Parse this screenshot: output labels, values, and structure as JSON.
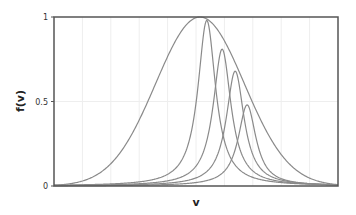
{
  "chart_data": {
    "type": "line",
    "title": "",
    "xlabel": "v",
    "ylabel": "f(v)",
    "xlim": [
      0,
      10
    ],
    "ylim": [
      0,
      1
    ],
    "x_ticks_labeled": false,
    "y_ticks": [
      {
        "value": 0,
        "label": "0"
      },
      {
        "value": 0.5,
        "label": "0.5"
      },
      {
        "value": 1,
        "label": "1"
      }
    ],
    "grid": {
      "vertical": true,
      "horizontal": true,
      "x_step": 1,
      "y_step": 0.5
    },
    "legend": null,
    "colors": {
      "frame": "#555555",
      "grid": "#eeeeee",
      "curve": "#8a8a8a",
      "text": "#222222"
    },
    "series": [
      {
        "name": "envelope",
        "shape": "gaussian",
        "center": 5.14,
        "sigma": 1.56,
        "peak": 1.0
      },
      {
        "name": "peak-1",
        "shape": "lorentzian",
        "center": 5.38,
        "width": 0.38,
        "peak": 0.98
      },
      {
        "name": "peak-2",
        "shape": "lorentzian",
        "center": 5.92,
        "width": 0.38,
        "peak": 0.81
      },
      {
        "name": "peak-3",
        "shape": "lorentzian",
        "center": 6.38,
        "width": 0.38,
        "peak": 0.68
      },
      {
        "name": "peak-4",
        "shape": "lorentzian",
        "center": 6.8,
        "width": 0.38,
        "peak": 0.48
      }
    ]
  }
}
